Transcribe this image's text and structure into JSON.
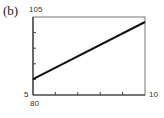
{
  "panel_label": "(b)",
  "labels": {
    "y_top": "105",
    "x_left": "5",
    "y_bottom": "80",
    "x_right": "10"
  },
  "chart_data": {
    "type": "line",
    "title": "(b)",
    "xlabel": "",
    "ylabel": "",
    "xlim": [
      5,
      10
    ],
    "ylim": [
      80,
      105
    ],
    "x_ticks_count": 6,
    "y_ticks_count": 6,
    "grid": false,
    "series": [
      {
        "name": "line",
        "x": [
          5,
          10
        ],
        "y": [
          85.1,
          103.4
        ]
      }
    ]
  }
}
